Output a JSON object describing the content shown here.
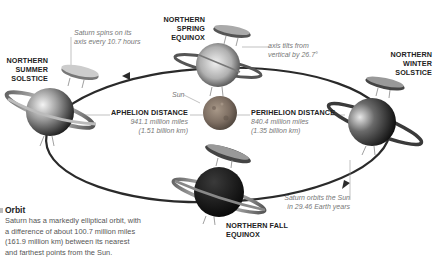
{
  "diagram": {
    "top_cut_text": "the Sun's equator (red)",
    "center": {
      "label": "Sun"
    },
    "positions": [
      {
        "id": "summer",
        "label_lines": [
          "NORTHERN",
          "SUMMER",
          "SOLSTICE"
        ]
      },
      {
        "id": "spring",
        "label_lines": [
          "NORTHERN",
          "SPRING",
          "EQUINOX"
        ]
      },
      {
        "id": "winter",
        "label_lines": [
          "NORTHERN",
          "WINTER",
          "SOLSTICE"
        ]
      },
      {
        "id": "fall",
        "label_lines": [
          "NORTHERN FALL",
          "EQUINOX"
        ]
      }
    ],
    "annotations": {
      "spin": [
        "Saturn spins on its",
        "axis every 10.7 hours"
      ],
      "tilt": [
        "axis tilts from",
        "vertical by 26.7°"
      ],
      "period": [
        "Saturn orbits the Sun",
        "in 29.46 Earth years"
      ]
    },
    "aphelion": {
      "title": "APHELION DISTANCE",
      "miles": "941.1 million miles",
      "km": "(1.51 billion km)"
    },
    "perihelion": {
      "title": "PERIHELION DISTANCE",
      "miles": "840.4 million miles",
      "km": "(1.35 billion km)"
    },
    "orbit_note": {
      "title": "Orbit",
      "lines": [
        "Saturn has a markedly elliptical orbit, with",
        "a difference of about 100.7 million miles",
        "(161.9 million km) between its nearest",
        "and farthest points from the Sun."
      ]
    },
    "colors": {
      "orbit_line": "#2a2a2a",
      "label_bold": "#222222",
      "label_italic": "#777777",
      "sun": "#8a7a6a"
    }
  }
}
